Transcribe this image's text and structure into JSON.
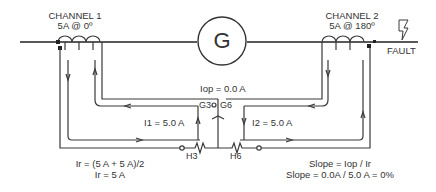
{
  "diagram": {
    "generator": {
      "symbol": "G"
    },
    "channel1": {
      "name": "CHANNEL 1",
      "current": "5A @ 0º"
    },
    "channel2": {
      "name": "CHANNEL 2",
      "current": "5A @ 180º"
    },
    "fault": {
      "label": "FAULT",
      "icon": "lightning-bolt-icon"
    },
    "iop": "Iop = 0.0 A",
    "i1": "I1 = 5.0 A",
    "i2": "I2 = 5.0 A",
    "terminals": {
      "g3": "G3",
      "g6": "G6",
      "h3": "H3",
      "h6": "H6"
    },
    "restraint": {
      "line1": "Ir = (5 A + 5 A)/2",
      "line2": "Ir = 5 A"
    },
    "slope": {
      "line1": "Slope = Iop / Ir",
      "line2": "Slope = 0.0A / 5.0 A = 0%"
    },
    "colors": {
      "line": "#3a3a3a",
      "bus": "#222222",
      "background": "#ffffff"
    }
  }
}
